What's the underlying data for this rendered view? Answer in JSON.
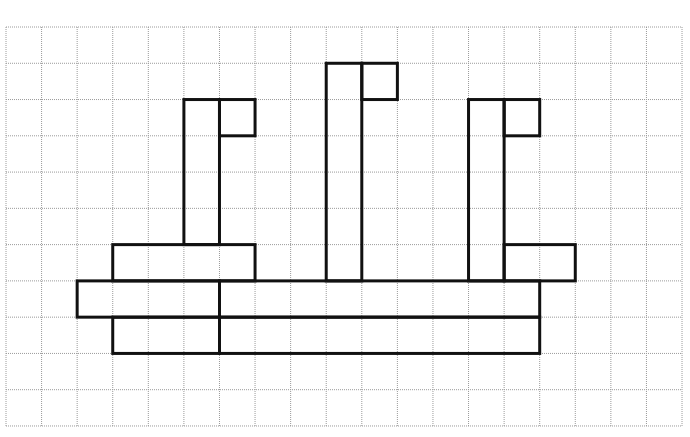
{
  "grid": {
    "origin_x": 6,
    "origin_y": 27,
    "cols": 19,
    "rows": 11,
    "cell_w": 35.58,
    "cell_h": 36.27,
    "line_color": "#9a9a9a"
  },
  "figure": {
    "stroke_color": "#111111",
    "rects": [
      {
        "name": "left-tower",
        "c0": 5,
        "r0": 2,
        "c1": 6,
        "r1": 6
      },
      {
        "name": "left-tower-hook",
        "c0": 6,
        "r0": 2,
        "c1": 7,
        "r1": 3
      },
      {
        "name": "middle-tower",
        "c0": 9,
        "r0": 1,
        "c1": 10,
        "r1": 7
      },
      {
        "name": "middle-tower-hook",
        "c0": 10,
        "r0": 1,
        "c1": 11,
        "r1": 2
      },
      {
        "name": "right-tower",
        "c0": 13,
        "r0": 2,
        "c1": 14,
        "r1": 7
      },
      {
        "name": "right-tower-hook",
        "c0": 14,
        "r0": 2,
        "c1": 15,
        "r1": 3
      },
      {
        "name": "left-block",
        "c0": 3,
        "r0": 6,
        "c1": 7,
        "r1": 7
      },
      {
        "name": "right-block",
        "c0": 14,
        "r0": 6,
        "c1": 16,
        "r1": 7
      },
      {
        "name": "middle-bar",
        "c0": 2,
        "r0": 7,
        "c1": 15,
        "r1": 8
      },
      {
        "name": "bottom-bar",
        "c0": 3,
        "r0": 8,
        "c1": 15,
        "r1": 9
      }
    ],
    "lines": [
      {
        "name": "middle-bar-divider",
        "c0": 6,
        "r0": 7,
        "c1": 6,
        "r1": 8
      },
      {
        "name": "bottom-bar-divider",
        "c0": 6,
        "r0": 8,
        "c1": 6,
        "r1": 9
      }
    ]
  }
}
